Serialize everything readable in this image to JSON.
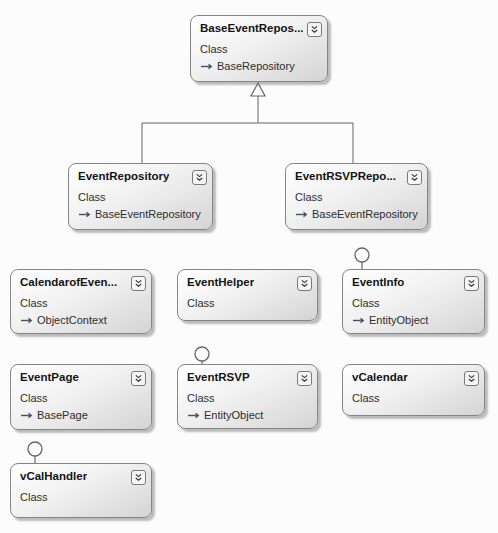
{
  "diagram": {
    "kind": "class-diagram",
    "background_color": "#fcfcfc",
    "box_border_color": "#858585",
    "box_gradient": [
      "#ffffff",
      "#d4d4d4"
    ],
    "connector_color": "#666666",
    "classes": [
      {
        "id": "base-event-repository",
        "title": "BaseEventRepos...",
        "kind": "Class",
        "base": "BaseRepository",
        "x": 190,
        "y": 15,
        "w": 138,
        "h": 67
      },
      {
        "id": "event-repository",
        "title": "EventRepository",
        "kind": "Class",
        "base": "BaseEventRepository",
        "x": 68,
        "y": 163,
        "w": 145,
        "h": 67
      },
      {
        "id": "event-rsvp-repository",
        "title": "EventRSVPRepo...",
        "kind": "Class",
        "base": "BaseEventRepository",
        "x": 285,
        "y": 163,
        "w": 143,
        "h": 67
      },
      {
        "id": "calendar-of-events",
        "title": "CalendarofEven...",
        "kind": "Class",
        "base": "ObjectContext",
        "x": 10,
        "y": 269,
        "w": 142,
        "h": 65
      },
      {
        "id": "event-helper",
        "title": "EventHelper",
        "kind": "Class",
        "base": null,
        "x": 177,
        "y": 269,
        "w": 141,
        "h": 52
      },
      {
        "id": "event-info",
        "title": "EventInfo",
        "kind": "Class",
        "base": "EntityObject",
        "x": 342,
        "y": 269,
        "w": 143,
        "h": 65
      },
      {
        "id": "event-page",
        "title": "EventPage",
        "kind": "Class",
        "base": "BasePage",
        "x": 10,
        "y": 364,
        "w": 142,
        "h": 66
      },
      {
        "id": "event-rsvp",
        "title": "EventRSVP",
        "kind": "Class",
        "base": "EntityObject",
        "x": 177,
        "y": 364,
        "w": 141,
        "h": 65
      },
      {
        "id": "v-calendar",
        "title": "vCalendar",
        "kind": "Class",
        "base": null,
        "x": 342,
        "y": 364,
        "w": 143,
        "h": 52
      },
      {
        "id": "v-cal-handler",
        "title": "vCalHandler",
        "kind": "Class",
        "base": null,
        "x": 10,
        "y": 463,
        "w": 142,
        "h": 55
      }
    ],
    "icons": {
      "expander": "chevron-double-down-icon",
      "base_row": "inherits-arrow-icon",
      "lollipop": "interface-lollipop-icon"
    },
    "connectors": {
      "inheritance": {
        "type": "generalization",
        "parent": "BaseEventRepos...",
        "children": [
          "EventRepository",
          "EventRSVPRepo..."
        ],
        "apex_x": 258,
        "apex_y": 83,
        "triangle_half_w": 7,
        "triangle_base_y": 96,
        "branch_y": 123,
        "child_drop_xs": [
          142,
          353
        ],
        "child_top_y": 163
      },
      "lollipops": [
        {
          "owner": "EventInfo",
          "cx": 362,
          "cy": 255,
          "r": 7,
          "stem_to_y": 269
        },
        {
          "owner": "EventRSVP",
          "cx": 202,
          "cy": 354,
          "r": 7,
          "stem_to_y": 364
        },
        {
          "owner": "vCalHandler",
          "cx": 35,
          "cy": 449,
          "r": 7,
          "stem_to_y": 463
        }
      ]
    }
  }
}
